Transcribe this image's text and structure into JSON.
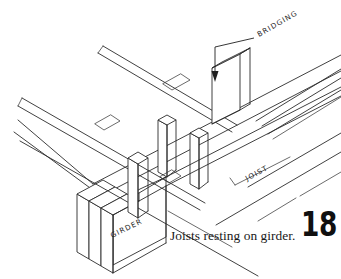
{
  "figure": {
    "caption": "Joists resting on girder.",
    "page_number": "18",
    "callouts": {
      "bridging": "BRIDGING",
      "joist": "JOIST",
      "girder": "GIRDER"
    },
    "colors": {
      "line": "#2b2b2b",
      "background": "#ffffff",
      "text": "#181818"
    }
  }
}
